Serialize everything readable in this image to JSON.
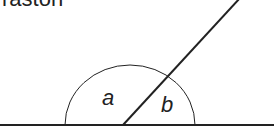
{
  "title_fragment": "raston",
  "diagram": {
    "angle_labels": [
      "a",
      "b"
    ],
    "colors": {
      "stroke": "#222222",
      "background": "#ffffff"
    }
  }
}
